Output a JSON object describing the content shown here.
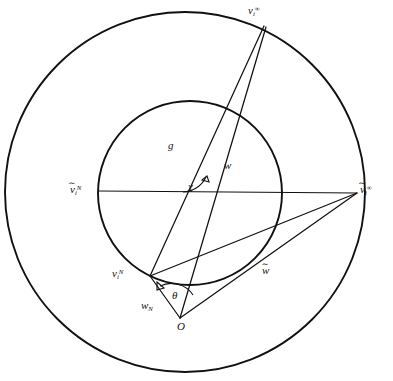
{
  "figure": {
    "background_color": "#ffffff",
    "stroke_color": "#111111",
    "width": 393,
    "height": 381
  },
  "labels": {
    "vi_infinity": {
      "base": "v",
      "sub": "i",
      "sup": "∞",
      "name": "v_i^infinity"
    },
    "vtilde_infinity": {
      "base": "v",
      "sub": "i",
      "sup": "∞",
      "tilde": "∼",
      "name": "v-tilde_i^infinity"
    },
    "vtilde_N": {
      "base": "v",
      "sub": "i",
      "sup": "N",
      "tilde": "∼",
      "name": "v-tilde_i^N"
    },
    "vi_N": {
      "base": "v",
      "sub": "i",
      "sup": "N",
      "name": "v_i^N"
    },
    "g": {
      "text": "g",
      "name": "g"
    },
    "w": {
      "text": "w",
      "name": "w"
    },
    "chi": {
      "text": "χ",
      "name": "chi-angle"
    },
    "w_tilde": {
      "base": "w",
      "tilde": "∼",
      "name": "w-tilde"
    },
    "w_N": {
      "base": "w",
      "sub": "N",
      "name": "w_N"
    },
    "theta": {
      "text": "θ",
      "name": "theta-angle"
    },
    "origin": {
      "text": "O",
      "name": "origin-O"
    }
  },
  "geometry": {
    "outer_circle": {
      "cx": 185,
      "cy": 192,
      "r": 180
    },
    "inner_circle": {
      "cx": 190,
      "cy": 193,
      "r": 92
    },
    "points": {
      "O": {
        "x": 180,
        "y": 318
      },
      "vi_infinity": {
        "x": 265,
        "y": 25
      },
      "vtilde_infinity": {
        "x": 357,
        "y": 193
      },
      "vtilde_N": {
        "x": 99,
        "y": 191
      },
      "vi_N": {
        "x": 150,
        "y": 276
      }
    },
    "segments": [
      {
        "name": "axis-vtildeN-to-vtildeInf",
        "from": "vtilde_N",
        "to": "vtilde_infinity"
      },
      {
        "name": "ray-O-to-viInf",
        "from": "O",
        "to": "vi_infinity"
      },
      {
        "name": "ray-viN-to-viInf",
        "from": "vi_N",
        "to": "vi_infinity"
      },
      {
        "name": "ray-O-to-viN",
        "from": "O",
        "to": "vi_N"
      },
      {
        "name": "ray-O-to-vtildeInf",
        "from": "O",
        "to": "vtilde_infinity"
      },
      {
        "name": "ray-viN-to-vtildeInf",
        "from": "vi_N",
        "to": "vtilde_infinity"
      }
    ],
    "angles": [
      {
        "name": "chi",
        "vertex_region": "horizontal-axis-crossing",
        "symbol": "χ"
      },
      {
        "name": "theta",
        "vertex": "O",
        "symbol": "θ"
      }
    ]
  }
}
